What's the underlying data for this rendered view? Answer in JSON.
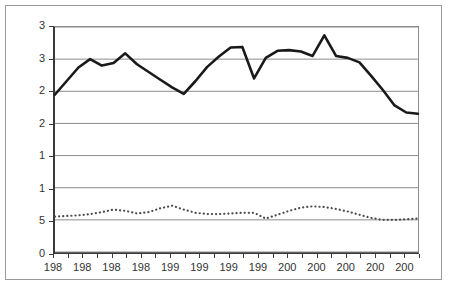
{
  "chart_data": {
    "type": "line",
    "title": "",
    "subtitle": "",
    "xlabel": "",
    "ylabel": "",
    "grid": true,
    "legend": "none",
    "note_on_cropping": "Axis tick labels are clipped by the image crop: y labels show only their leading digit and x labels show only their first three digits.",
    "ylim": [
      0,
      3.5
    ],
    "y_ticks": [
      3.5,
      3.0,
      2.5,
      2.0,
      1.5,
      1.0,
      0.5,
      0.0
    ],
    "y_tick_labels": [
      "3",
      "3",
      "2",
      "2",
      "1",
      "1",
      "5",
      "0"
    ],
    "y_tick_labels_full": [
      "3.5",
      "3.0",
      "2.5",
      "2.0",
      "1.5",
      "1.0",
      "0.5",
      "0.0"
    ],
    "x_tick_labels": [
      "198",
      "198",
      "198",
      "198",
      "199",
      "199",
      "199",
      "199",
      "200",
      "200",
      "200",
      "200",
      "200"
    ],
    "x_tick_count": 26,
    "x_label_every_n_ticks": 2,
    "x": [
      0,
      1,
      2,
      3,
      4,
      5,
      6,
      7,
      8,
      9,
      10,
      11,
      12,
      13,
      14,
      15,
      16,
      17,
      18,
      19,
      20,
      21,
      22,
      23,
      24,
      25
    ],
    "series": [
      {
        "name": "solid-series",
        "style": "solid",
        "color": "#1a1a1a",
        "width": 2.6,
        "values": [
          2.45,
          2.66,
          2.87,
          3.0,
          2.9,
          2.94,
          3.09,
          2.92,
          2.8,
          2.68,
          2.56,
          2.46,
          2.66,
          2.88,
          3.04,
          3.18,
          3.19,
          2.7,
          3.02,
          3.13,
          3.14,
          3.12,
          3.05,
          3.37,
          3.05,
          3.02
        ]
      },
      {
        "name": "dotted-series",
        "style": "dotted",
        "color": "#4a4a4a",
        "width": 2.2,
        "values": [
          0.55,
          0.56,
          0.57,
          0.59,
          0.62,
          0.66,
          0.64,
          0.6,
          0.62,
          0.68,
          0.72,
          0.66,
          0.61,
          0.59,
          0.59,
          0.6,
          0.61,
          0.61,
          0.52,
          0.58,
          0.64,
          0.69,
          0.71,
          0.7,
          0.67,
          0.63
        ]
      }
    ],
    "solid_series_tail": [
      2.95,
      2.74,
      2.52,
      2.28,
      2.17,
      2.15
    ],
    "dotted_series_tail": [
      0.58,
      0.53,
      0.5,
      0.5,
      0.51,
      0.52
    ]
  }
}
